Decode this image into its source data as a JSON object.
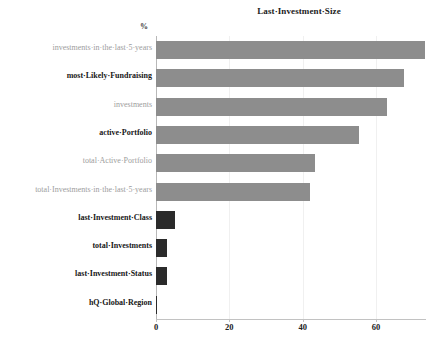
{
  "chart_data": {
    "type": "bar",
    "orientation": "horizontal",
    "title": "Last·Investment·Size",
    "xlabel": "",
    "ylabel": "%",
    "xlim": [
      0,
      78
    ],
    "grid": true,
    "legend": null,
    "xticks": [
      0,
      20,
      40,
      60
    ],
    "xticklabels": [
      "0",
      "20",
      "40",
      "60"
    ],
    "categories": [
      "investments·in·the·last·5·years",
      "most·Likely·Fundraising",
      "investments",
      "active·Portfolio",
      "total·Active·Portfolio",
      "total·Investments·in·the·last·5·years",
      "last·Investment·Class",
      "total·Investments",
      "last·Investment·Status",
      "hQ·Global·Region"
    ],
    "values": [
      73.3,
      67.5,
      63.1,
      55.3,
      43.3,
      42.0,
      5.2,
      3.1,
      3.0,
      0.3
    ],
    "bar_colors": [
      "#8d8d8d",
      "#8d8d8d",
      "#8d8d8d",
      "#8d8d8d",
      "#8d8d8d",
      "#8d8d8d",
      "#2b2b2b",
      "#2b2b2b",
      "#2b2b2b",
      "#2b2b2b"
    ],
    "label_styles": [
      "muted",
      "strong",
      "muted",
      "strong",
      "muted",
      "muted",
      "strong",
      "strong",
      "strong",
      "strong"
    ]
  },
  "colors": {
    "bar_light": "#8d8d8d",
    "bar_dark": "#2b2b2b",
    "axis": "#c2c2c2",
    "grid": "#f0f0f0",
    "text_strong": "#171717",
    "text_muted": "#9d9d9d",
    "background": "#ffffff"
  }
}
